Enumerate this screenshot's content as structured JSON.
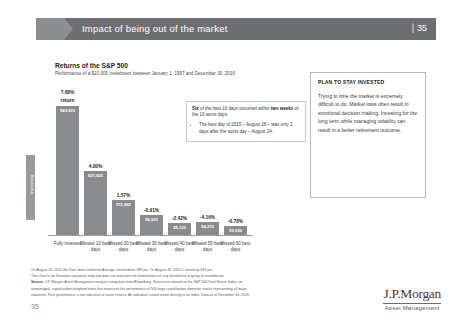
{
  "header": {
    "title": "Impact of being out of the market",
    "slide_number": "35",
    "separator": "|"
  },
  "side_tab": {
    "label": "Investing"
  },
  "chart_header": {
    "title": "Returns of the S&P 500",
    "subtitle": "Performance of a $10,000 investment between January 1, 1997 and December 30, 2016"
  },
  "chart_data": {
    "type": "bar",
    "title": "Returns of the S&P 500",
    "subtitle": "Performance of a $10,000 investment between January 1, 1997 and December 30, 2016",
    "xlabel": "",
    "ylabel": "",
    "ylim": [
      0,
      45000
    ],
    "grid": false,
    "legend": "none",
    "categories": [
      "Fully invested",
      "Missed 10 best days",
      "Missed 20 best days",
      "Missed 30 best days",
      "Missed 40 best days",
      "Missed 50 best days",
      "Missed 60 best days"
    ],
    "values": [
      43933,
      21925,
      11962,
      6923,
      4132,
      4275,
      3030
    ],
    "value_labels": [
      "$43,933",
      "$21,925",
      "$11,962",
      "$6,923",
      "$5,132",
      "$4,275",
      "$3,030"
    ],
    "percent_labels": [
      "7.68%",
      "4.00%",
      "1.57%",
      "-0.91%",
      "-2.42%",
      "-4.16%",
      "-6.78%"
    ],
    "first_bar_note": "return",
    "bar_color": "#8a8b8d"
  },
  "callout": {
    "lead": "Six",
    "text1": " of the best 10 days occurred within ",
    "bold2": "two weeks",
    "text2": " of the 10 worst days",
    "bullet": "The best day of 2015 – August 26 – was only 2 days after the worst day – August 24."
  },
  "panel": {
    "heading": "PLAN TO STAY INVESTED",
    "body": "Trying to time the market is extremely difficult to do. Market lows often result in emotional decision making. Investing for the long term while managing volatility can result in a better retirement outcome."
  },
  "footnotes": {
    "line1": "On August 24, 2015 the Dow Jones Industrial Average closed down 588 pts. On August 26, 2015 it closed up 619 pts.",
    "line2": "This chart is for illustrative purposes only and does not represent the performance of any investment or group of investments.",
    "source_label": "Source:",
    "line3": " J.P. Morgan Asset Management analysis using data from Bloomberg. Returns are based on the S&P 500 Total Return Index, an",
    "line4": "unmanaged, capitalization-weighted index that measures the performance of 500 large capitalization domestic stocks representing all major",
    "line5": "industries. Past performance is not indicative of future returns. An individual cannot invest directly in an index. Data as of December 30, 2016."
  },
  "page_number": "35",
  "logo": {
    "name": "J.P.Morgan",
    "tagline": "Asset Management"
  }
}
